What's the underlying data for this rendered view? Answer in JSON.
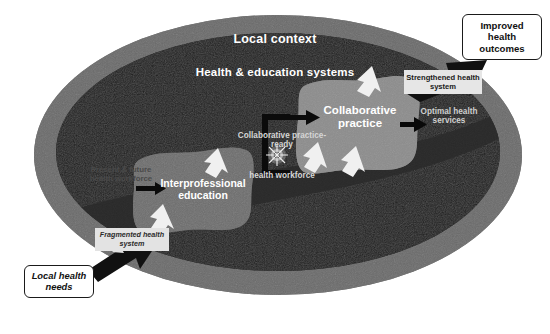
{
  "diagram": {
    "title": "Health professional education and collaborative practice framework",
    "rings": [
      {
        "id": "local-context",
        "label": "Local context",
        "color": "#6b6b6b"
      },
      {
        "id": "health-education-systems",
        "label": "Health & education systems",
        "color": "#1c1c1c"
      }
    ],
    "blobs": [
      {
        "id": "interprofessional-education",
        "label": "Interprofessional education",
        "color": "#6e6e6e"
      },
      {
        "id": "collaborative-practice",
        "label": "Collaborative practice",
        "color": "#8a8a8a"
      }
    ],
    "inner_labels": {
      "present_future_workforce": "Present & future health workforce",
      "collaborative_practice_ready_line1": "Collaborative practice-ready",
      "collaborative_practice_ready_line2": "health workforce",
      "optimal_health_services": "Optimal health services"
    },
    "callouts": [
      {
        "id": "fragmented-health-system",
        "label": "Fragmented health system",
        "style": "grey-italic"
      },
      {
        "id": "strengthened-health-system",
        "label": "Strengthened health system",
        "style": "grey-bold"
      },
      {
        "id": "improved-health-outcomes",
        "label": "Improved health outcomes",
        "style": "white-rounded"
      },
      {
        "id": "local-health-needs",
        "label": "Local health needs",
        "style": "white-rounded-italic"
      }
    ],
    "icons": {
      "starburst": "starburst-icon",
      "arrow_right": "arrow-right-icon",
      "block_arrow": "block-arrow-icon"
    },
    "colors": {
      "background": "#ffffff",
      "outer_ring": "#6b6b6b",
      "inner_field": "#1c1c1c",
      "blob_education": "#6e6e6e",
      "blob_practice": "#8a8a8a",
      "arrow_white": "#f2f2f2",
      "arrow_black": "#0d0d0d",
      "callout_grey": "#e4e4e4",
      "text_white": "#ffffff",
      "text_dark": "#111111"
    }
  }
}
